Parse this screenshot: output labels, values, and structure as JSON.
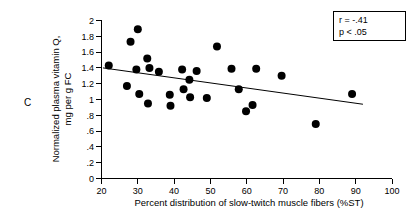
{
  "panel": {
    "label": "C"
  },
  "chart_data": {
    "type": "scatter",
    "title": "",
    "xlabel": "Percent distribution of slow-twitch muscle fibers (%ST)",
    "ylabel": "Normalized plasma vitamin Q, mg per g FC",
    "ylabel_line1": "Normalized plasma vitamin Q,",
    "ylabel_line2": "mg per g FC",
    "xlim": [
      20,
      100
    ],
    "ylim": [
      0,
      2
    ],
    "xticks": [
      20,
      30,
      40,
      50,
      60,
      70,
      80,
      90,
      100
    ],
    "xticklabels": [
      "20",
      "30",
      "40",
      "50",
      "60",
      "70",
      "80",
      "90",
      "100"
    ],
    "yticks": [
      0,
      0.2,
      0.4,
      0.6,
      0.8,
      1,
      1.2,
      1.4,
      1.6,
      1.8,
      2
    ],
    "yticklabels": [
      "0",
      ".2",
      ".4",
      ".6",
      ".8",
      "1",
      "1.2",
      "1.4",
      "1.6",
      "1.8",
      "2"
    ],
    "grid": false,
    "legend_position": "top-right",
    "marker": {
      "shape": "circle",
      "color": "#000000",
      "size_px": 5.2
    },
    "points": [
      {
        "x": 22.0,
        "y": 1.43
      },
      {
        "x": 27.0,
        "y": 1.17
      },
      {
        "x": 28.0,
        "y": 1.73
      },
      {
        "x": 30.0,
        "y": 1.89
      },
      {
        "x": 29.6,
        "y": 1.38
      },
      {
        "x": 30.4,
        "y": 1.07
      },
      {
        "x": 32.6,
        "y": 1.52
      },
      {
        "x": 33.2,
        "y": 1.4
      },
      {
        "x": 32.8,
        "y": 0.95
      },
      {
        "x": 35.8,
        "y": 1.35
      },
      {
        "x": 38.8,
        "y": 1.06
      },
      {
        "x": 39.0,
        "y": 0.92
      },
      {
        "x": 42.2,
        "y": 1.38
      },
      {
        "x": 42.6,
        "y": 1.13
      },
      {
        "x": 44.2,
        "y": 1.25
      },
      {
        "x": 44.4,
        "y": 1.03
      },
      {
        "x": 46.2,
        "y": 1.36
      },
      {
        "x": 49.0,
        "y": 1.02
      },
      {
        "x": 51.8,
        "y": 1.67
      },
      {
        "x": 55.8,
        "y": 1.39
      },
      {
        "x": 57.8,
        "y": 1.13
      },
      {
        "x": 59.8,
        "y": 0.85
      },
      {
        "x": 61.6,
        "y": 0.93
      },
      {
        "x": 62.6,
        "y": 1.39
      },
      {
        "x": 69.6,
        "y": 1.3
      },
      {
        "x": 79.0,
        "y": 0.69
      },
      {
        "x": 89.0,
        "y": 1.07
      }
    ],
    "trend_line": {
      "x_start": 20.4,
      "y_start": 1.4,
      "x_end": 92.0,
      "y_end": 0.94
    },
    "annotations": {
      "r_value": "r = -.41",
      "p_value": "p < .05"
    }
  }
}
